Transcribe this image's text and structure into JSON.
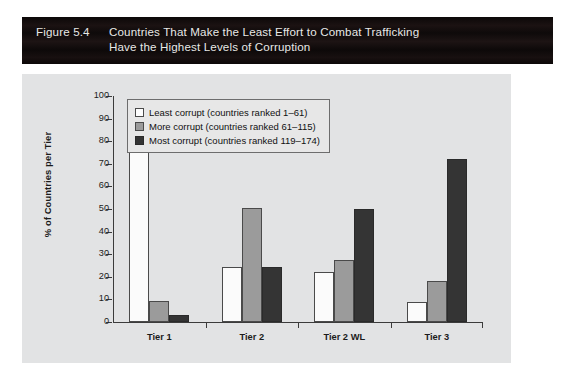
{
  "banner": {
    "figure_number": "Figure 5.4",
    "title_line_1": "Countries That Make the Least Effort to Combat Trafficking",
    "title_line_2": "Have the Highest Levels of Corruption",
    "background_color": "#120d0d",
    "text_color": "#e8e8e6"
  },
  "chart_data": {
    "type": "bar",
    "title": "Countries That Make the Least Effort to Combat Trafficking Have the Highest Levels of Corruption",
    "xlabel": "",
    "ylabel": "% of Countries per Tier",
    "categories": [
      "Tier 1",
      "Tier 2",
      "Tier 2 WL",
      "Tier 3"
    ],
    "series": [
      {
        "name": "Least corrupt (countries ranked 1–61)",
        "color": "#fbfbfb",
        "values": [
          87,
          24.5,
          22,
          9
        ]
      },
      {
        "name": "More corrupt (countries ranked 61–115)",
        "color": "#9b9b9b",
        "values": [
          9.5,
          50.5,
          27.5,
          18
        ]
      },
      {
        "name": "Most corrupt (countries ranked 119–174)",
        "color": "#343434",
        "values": [
          3,
          24.5,
          50,
          72
        ]
      }
    ],
    "ylim": [
      0,
      100
    ],
    "yticks": [
      0,
      10,
      20,
      30,
      40,
      50,
      60,
      70,
      80,
      90,
      100
    ],
    "ytick_labels": [
      "0",
      "10",
      "20",
      "30",
      "40",
      "50",
      "60",
      "70",
      "80",
      "90",
      "100"
    ],
    "grid": false,
    "legend_position": "top-center-inside",
    "plot_background": "#e2e3e4"
  }
}
